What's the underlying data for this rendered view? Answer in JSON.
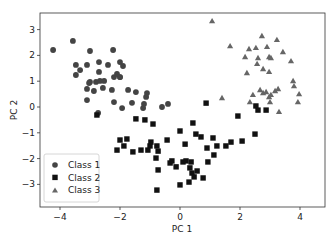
{
  "chart_data": {
    "type": "scatter",
    "title": "",
    "xlabel": "PC 1",
    "ylabel": "PC 2",
    "xlim": [
      -4.67,
      4.83
    ],
    "ylim": [
      -3.5,
      3.6
    ],
    "xticks": [
      -4,
      -2,
      0,
      2,
      4
    ],
    "yticks": [
      -3,
      -2,
      -1,
      0,
      1,
      2,
      3
    ],
    "grid": false,
    "legend_position": "lower left",
    "series": [
      {
        "name": "Class 1",
        "marker": "circle",
        "color": "#444444",
        "points": [
          [
            -4.23,
            2.21
          ],
          [
            -3.57,
            2.56
          ],
          [
            -3.0,
            2.17
          ],
          [
            -2.23,
            2.21
          ],
          [
            -3.47,
            1.63
          ],
          [
            -3.1,
            1.63
          ],
          [
            -2.7,
            1.74
          ],
          [
            -2.4,
            1.63
          ],
          [
            -2.0,
            1.74
          ],
          [
            -1.9,
            1.59
          ],
          [
            -3.33,
            1.43
          ],
          [
            -3.47,
            1.24
          ],
          [
            -2.7,
            1.36
          ],
          [
            -2.1,
            1.28
          ],
          [
            -2.0,
            1.16
          ],
          [
            -3.0,
            0.97
          ],
          [
            -2.8,
            0.97
          ],
          [
            -2.67,
            1.01
          ],
          [
            -2.53,
            1.01
          ],
          [
            -2.2,
            1.16
          ],
          [
            -2.0,
            1.16
          ],
          [
            -3.03,
            0.93
          ],
          [
            -3.1,
            0.7
          ],
          [
            -2.87,
            0.62
          ],
          [
            -2.57,
            0.74
          ],
          [
            -2.27,
            0.66
          ],
          [
            -1.73,
            0.66
          ],
          [
            -1.47,
            0.58
          ],
          [
            -1.1,
            0.54
          ],
          [
            -1.13,
            0.39
          ],
          [
            -3.1,
            0.27
          ],
          [
            -2.2,
            0.19
          ],
          [
            -1.93,
            -0.04
          ],
          [
            -1.6,
            0.16
          ],
          [
            -1.2,
            0.12
          ],
          [
            -1.23,
            -0.04
          ],
          [
            -2.73,
            -0.23
          ],
          [
            -0.6,
            0.0
          ],
          [
            -0.4,
            0.12
          ]
        ]
      },
      {
        "name": "Class 2",
        "marker": "square",
        "color": "#111111",
        "points": [
          [
            -2.77,
            -0.31
          ],
          [
            -1.47,
            -0.46
          ],
          [
            -1.17,
            -0.5
          ],
          [
            -0.9,
            -0.66
          ],
          [
            2.87,
            -0.12
          ],
          [
            0.87,
            0.15
          ],
          [
            1.93,
            -0.35
          ],
          [
            0.43,
            -0.62
          ],
          [
            0.0,
            -0.93
          ],
          [
            0.53,
            -1.05
          ],
          [
            0.7,
            -1.16
          ],
          [
            -0.43,
            -1.28
          ],
          [
            1.1,
            -1.2
          ],
          [
            -2.0,
            -1.28
          ],
          [
            -1.77,
            -1.24
          ],
          [
            -1.87,
            -1.51
          ],
          [
            -2.1,
            -1.67
          ],
          [
            -1.57,
            -1.74
          ],
          [
            -1.3,
            -1.67
          ],
          [
            -1.0,
            -1.51
          ],
          [
            -1.07,
            -1.67
          ],
          [
            -0.77,
            -1.51
          ],
          [
            0.17,
            -1.44
          ],
          [
            1.23,
            -1.51
          ],
          [
            0.9,
            -1.59
          ],
          [
            1.53,
            -1.51
          ],
          [
            1.7,
            -1.36
          ],
          [
            2.07,
            -1.32
          ],
          [
            2.5,
            -1.05
          ],
          [
            -0.73,
            -1.71
          ],
          [
            -0.8,
            -1.98
          ],
          [
            -0.73,
            -2.44
          ],
          [
            -0.33,
            -2.17
          ],
          [
            -0.13,
            -2.32
          ],
          [
            0.1,
            -2.13
          ],
          [
            0.2,
            -2.09
          ],
          [
            0.37,
            -2.13
          ],
          [
            0.33,
            -2.36
          ],
          [
            0.4,
            -2.56
          ],
          [
            0.47,
            -2.71
          ],
          [
            0.57,
            -2.48
          ],
          [
            0.3,
            -2.91
          ],
          [
            0.0,
            -3.02
          ],
          [
            0.77,
            -2.75
          ],
          [
            0.93,
            -2.13
          ],
          [
            1.13,
            -1.86
          ],
          [
            -0.77,
            -3.22
          ],
          [
            2.6,
            -0.12
          ],
          [
            2.53,
            0.04
          ],
          [
            -0.27,
            -2.09
          ],
          [
            -0.97,
            -1.36
          ]
        ]
      },
      {
        "name": "Class 3",
        "marker": "triangle",
        "color": "#666666",
        "points": [
          [
            1.07,
            3.33
          ],
          [
            2.73,
            2.75
          ],
          [
            3.23,
            2.6
          ],
          [
            1.67,
            2.36
          ],
          [
            2.3,
            2.25
          ],
          [
            2.53,
            2.29
          ],
          [
            2.9,
            2.33
          ],
          [
            3.43,
            2.13
          ],
          [
            2.17,
            1.94
          ],
          [
            2.6,
            1.9
          ],
          [
            2.97,
            1.94
          ],
          [
            3.03,
            1.9
          ],
          [
            2.57,
            1.67
          ],
          [
            3.7,
            1.78
          ],
          [
            2.77,
            1.47
          ],
          [
            2.23,
            1.32
          ],
          [
            2.97,
            1.36
          ],
          [
            3.77,
            1.01
          ],
          [
            2.67,
            0.66
          ],
          [
            2.77,
            0.54
          ],
          [
            2.87,
            0.58
          ],
          [
            3.17,
            0.62
          ],
          [
            3.27,
            0.7
          ],
          [
            3.03,
            0.47
          ],
          [
            2.43,
            0.47
          ],
          [
            2.97,
            0.39
          ],
          [
            2.33,
            0.19
          ],
          [
            3.0,
            0.19
          ],
          [
            3.97,
            0.5
          ],
          [
            3.93,
            0.19
          ],
          [
            1.4,
            0.35
          ],
          [
            3.3,
            -0.19
          ],
          [
            3.8,
            0.81
          ]
        ]
      }
    ]
  },
  "axes": {
    "xlabel": "PC 1",
    "ylabel": "PC 2",
    "xtick_labels": [
      "−4",
      "−2",
      "0",
      "2",
      "4"
    ],
    "ytick_labels": [
      "3",
      "2",
      "1",
      "0",
      "−1",
      "−2",
      "−3"
    ]
  },
  "legend": {
    "items": [
      {
        "label": "Class 1",
        "marker": "circle"
      },
      {
        "label": "Class 2",
        "marker": "square"
      },
      {
        "label": "Class 3",
        "marker": "triangle"
      }
    ]
  }
}
